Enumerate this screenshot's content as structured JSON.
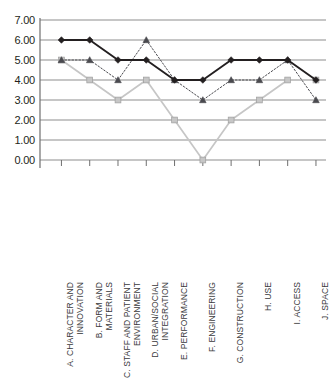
{
  "chart_data": {
    "type": "line",
    "title": "",
    "xlabel": "",
    "ylabel": "",
    "ylim": [
      0,
      7
    ],
    "ytick_step": 1,
    "grid": true,
    "legend": "none",
    "ytick_labels": [
      "7.00",
      "6.00",
      "5.00",
      "4.00",
      "3.00",
      "2.00",
      "1.00",
      "0.00"
    ],
    "categories": [
      "A. CHARACTER AND INNOVATION",
      "B. FORM AND MATERIALS",
      "C. STAFF AND PATIENT ENVIRONMENT",
      "D. URBAN/SOCIAL INTEGRATION",
      "E. PERFORMANCE",
      "F. ENGINEERING",
      "G. CONSTRUCTION",
      "H. USE",
      "I. ACCESS",
      "J. SPACE"
    ],
    "category_lines": [
      [
        "A.  CHARACTER AND",
        "INNOVATION"
      ],
      [
        "B.  FORM AND",
        "MATERIALS"
      ],
      [
        "C.  STAFF AND PATIENT",
        "ENVIRONMENT"
      ],
      [
        "D. URBAN/SOCIAL",
        "INTEGRATION"
      ],
      [
        "E. PERFORMANCE",
        ""
      ],
      [
        "F. ENGINEERING",
        ""
      ],
      [
        "G. CONSTRUCTION",
        ""
      ],
      [
        "H. USE",
        ""
      ],
      [
        "I. ACCESS",
        ""
      ],
      [
        "J. SPACE",
        ""
      ]
    ],
    "series": [
      {
        "name": "Series 1",
        "marker": "diamond",
        "line_style": "solid",
        "color": "#231f20",
        "values": [
          6.0,
          6.0,
          5.0,
          5.0,
          4.0,
          4.0,
          5.0,
          5.0,
          5.0,
          4.0
        ]
      },
      {
        "name": "Series 2",
        "marker": "triangle",
        "line_style": "dotted",
        "color": "#4a4a4f",
        "values": [
          5.0,
          5.0,
          4.0,
          6.0,
          4.0,
          3.0,
          4.0,
          4.0,
          5.0,
          3.0
        ]
      },
      {
        "name": "Series 3",
        "marker": "square",
        "line_style": "solid",
        "color": "#c6c6c6",
        "values": [
          5.0,
          4.0,
          3.0,
          4.0,
          2.0,
          0.0,
          2.0,
          3.0,
          4.0,
          4.0
        ]
      }
    ]
  }
}
